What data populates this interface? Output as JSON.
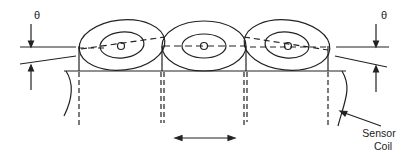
{
  "diagram": {
    "labels": {
      "theta_left": "θ",
      "theta_right": "θ",
      "sensor_line1": "Sensor",
      "sensor_line2": "Coil"
    },
    "colors": {
      "stroke": "#222222",
      "background": "#ffffff"
    },
    "elements": [
      "left-tilted-coil",
      "center-coil",
      "right-tilted-coil",
      "base-plate",
      "motion-arrow",
      "theta-dimension-left",
      "theta-dimension-right",
      "sensor-coil-pointer"
    ]
  }
}
